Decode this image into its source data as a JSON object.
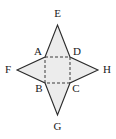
{
  "figure": {
    "name": "four-pointed-star-net",
    "canvas": {
      "width": 116,
      "height": 139
    },
    "colors": {
      "background": "#ffffff",
      "fill": "#ececec",
      "outline": "#2b2b2b",
      "dashed_line": "#3a3a3a",
      "label": "#1a1a1a"
    },
    "style": {
      "outline_width": 1.1,
      "dash_width": 1,
      "dash_pattern": "3,2"
    },
    "square": {
      "name": "inner-square-abcd",
      "vertices": [
        {
          "label": "A",
          "x": 45,
          "y": 57,
          "label_x": 38,
          "label_y": 52,
          "anchor": "middle"
        },
        {
          "label": "D",
          "x": 70,
          "y": 57,
          "label_x": 77,
          "label_y": 52,
          "anchor": "middle"
        },
        {
          "label": "C",
          "x": 70,
          "y": 83,
          "label_x": 76,
          "label_y": 89,
          "anchor": "middle"
        },
        {
          "label": "B",
          "x": 45,
          "y": 83,
          "label_x": 39,
          "label_y": 89,
          "anchor": "middle"
        }
      ]
    },
    "points": [
      {
        "label": "E",
        "position": "top",
        "x": 57.5,
        "y": 25,
        "label_x": 57.5,
        "label_y": 14,
        "anchor": "middle"
      },
      {
        "label": "F",
        "position": "left",
        "x": 17,
        "y": 70,
        "label_x": 8,
        "label_y": 70,
        "anchor": "middle"
      },
      {
        "label": "H",
        "position": "right",
        "x": 98,
        "y": 70,
        "label_x": 107,
        "label_y": 70,
        "anchor": "middle"
      },
      {
        "label": "G",
        "position": "bottom",
        "x": 57.5,
        "y": 115,
        "label_x": 57.5,
        "label_y": 127,
        "anchor": "middle"
      }
    ],
    "star_outline_path": "M 57.5 25 L 70 57 L 98 70 L 70 83 L 57.5 115 L 45 83 L 17 70 L 45 57 Z",
    "dashed_edges": [
      {
        "name": "edge-ad",
        "x1": 45,
        "y1": 57,
        "x2": 70,
        "y2": 57
      },
      {
        "name": "edge-dc",
        "x1": 70,
        "y1": 57,
        "x2": 70,
        "y2": 83
      },
      {
        "name": "edge-cb",
        "x1": 70,
        "y1": 83,
        "x2": 45,
        "y2": 83
      },
      {
        "name": "edge-ba",
        "x1": 45,
        "y1": 83,
        "x2": 45,
        "y2": 57
      }
    ],
    "labels": {
      "A": "A",
      "B": "B",
      "C": "C",
      "D": "D",
      "E": "E",
      "F": "F",
      "G": "G",
      "H": "H"
    }
  }
}
